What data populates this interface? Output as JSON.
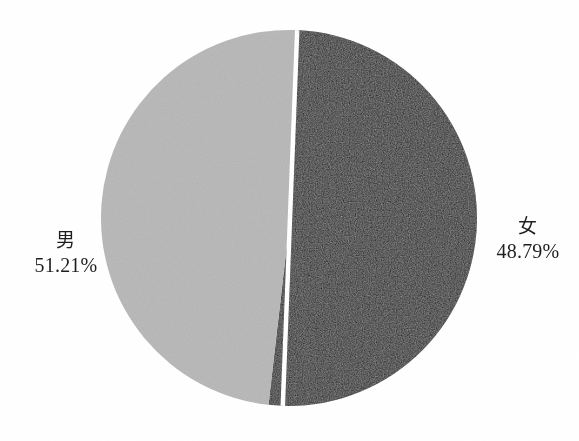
{
  "chart_data": {
    "type": "pie",
    "title": "",
    "subtitle": "",
    "xlabel": "",
    "ylabel": "",
    "legend_position": "none",
    "grid": false,
    "labels_shown": "category name and percentage outside slice",
    "categories": [
      "男",
      "女"
    ],
    "values": [
      51.21,
      48.79
    ],
    "value_unit": "%",
    "slices": [
      {
        "name": "男",
        "value": 51.21,
        "value_label": "51.21%",
        "color": "#1c1c1c",
        "label_side": "left",
        "start_angle_deg": 2.2,
        "sweep_deg": 184.36
      },
      {
        "name": "女",
        "value": 48.79,
        "value_label": "48.79%",
        "color": "#bcbcbc",
        "label_side": "right",
        "start_angle_deg": 186.56,
        "sweep_deg": 175.64
      }
    ],
    "geometry": {
      "center_x": 290,
      "center_y": 218,
      "radius": 188,
      "divider_color": "#ffffff",
      "divider_width_px": 4
    }
  },
  "page": {
    "background_color": "#ffffff"
  },
  "labels": {
    "male": {
      "name": "男",
      "value": "51.21%"
    },
    "female": {
      "name": "女",
      "value": "48.79%"
    }
  }
}
